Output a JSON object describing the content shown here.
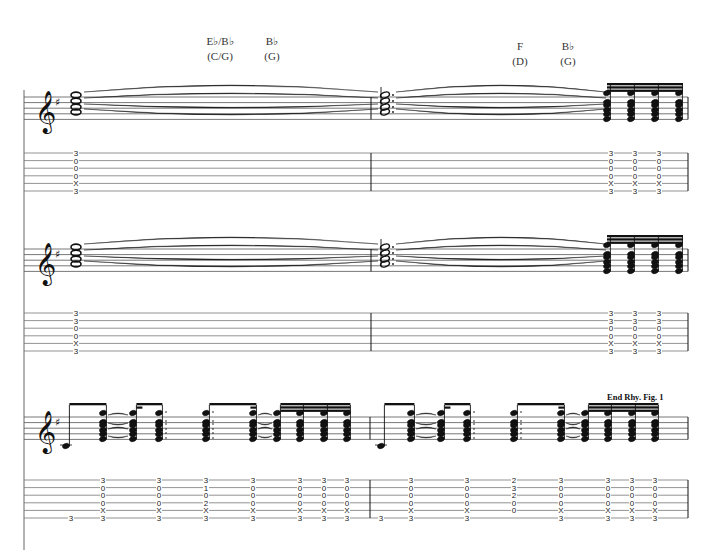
{
  "page": {
    "type": "guitar sheet music with tablature",
    "systems_count": 3
  },
  "chords": [
    {
      "name": "E♭/B♭",
      "capo": "(C/G)",
      "x": 220,
      "y": 34
    },
    {
      "name": "B♭",
      "capo": "(G)",
      "x": 272,
      "y": 34
    },
    {
      "name": "F",
      "capo": "(D)",
      "x": 520,
      "y": 39
    },
    {
      "name": "B♭",
      "capo": "(G)",
      "x": 568,
      "y": 39
    }
  ],
  "rhythm_figure_label": "End Rhy. Fig. 1",
  "clef": "treble",
  "key_signature": "G major (1 sharp)",
  "systems": [
    {
      "id": "system-1",
      "staff_top": 97,
      "tab_top": 153,
      "barline_x": 371,
      "tab_columns": [
        {
          "x": 76,
          "frets": [
            "3",
            "0",
            "0",
            "0",
            "X",
            "3"
          ]
        },
        {
          "x": 611,
          "frets": [
            "3",
            "0",
            "0",
            "0",
            "X",
            "3"
          ]
        },
        {
          "x": 635,
          "frets": [
            "3",
            "0",
            "0",
            "0",
            "X",
            "3"
          ]
        },
        {
          "x": 659,
          "frets": [
            "3",
            "0",
            "0",
            "0",
            "X",
            "3"
          ]
        }
      ]
    },
    {
      "id": "system-2",
      "staff_top": 249,
      "tab_top": 313,
      "barline_x": 371,
      "tab_columns": [
        {
          "x": 76,
          "frets": [
            "3",
            "3",
            "0",
            "0",
            "X",
            "3"
          ]
        },
        {
          "x": 611,
          "frets": [
            "3",
            "3",
            "0",
            "0",
            "X",
            "3"
          ]
        },
        {
          "x": 635,
          "frets": [
            "3",
            "3",
            "0",
            "0",
            "X",
            "3"
          ]
        },
        {
          "x": 659,
          "frets": [
            "3",
            "3",
            "0",
            "0",
            "X",
            "3"
          ]
        }
      ]
    },
    {
      "id": "system-3",
      "staff_top": 417,
      "tab_top": 480,
      "barline_x": 370,
      "tab_columns": [
        {
          "x": 71,
          "frets": [
            "",
            "",
            "",
            "",
            "",
            "3"
          ]
        },
        {
          "x": 103,
          "frets": [
            "3",
            "0",
            "0",
            "0",
            "X",
            "3"
          ]
        },
        {
          "x": 159,
          "frets": [
            "3",
            "0",
            "0",
            "0",
            "X",
            "3"
          ]
        },
        {
          "x": 206,
          "frets": [
            "3",
            "1",
            "0",
            "2",
            "X",
            "3"
          ]
        },
        {
          "x": 253,
          "frets": [
            "3",
            "0",
            "0",
            "0",
            "X",
            "3"
          ]
        },
        {
          "x": 300,
          "frets": [
            "3",
            "0",
            "0",
            "0",
            "X",
            "3"
          ]
        },
        {
          "x": 324,
          "frets": [
            "3",
            "0",
            "0",
            "0",
            "X",
            "3"
          ]
        },
        {
          "x": 347,
          "frets": [
            "3",
            "0",
            "0",
            "0",
            "X",
            "3"
          ]
        },
        {
          "x": 381,
          "frets": [
            "",
            "",
            "",
            "",
            "",
            "3"
          ]
        },
        {
          "x": 411,
          "frets": [
            "3",
            "0",
            "0",
            "0",
            "X",
            "3"
          ]
        },
        {
          "x": 467,
          "frets": [
            "3",
            "0",
            "0",
            "0",
            "X",
            "3"
          ]
        },
        {
          "x": 514,
          "frets": [
            "2",
            "3",
            "2",
            "0",
            "0",
            ""
          ]
        },
        {
          "x": 561,
          "frets": [
            "3",
            "0",
            "0",
            "0",
            "X",
            "3"
          ]
        },
        {
          "x": 608,
          "frets": [
            "3",
            "0",
            "0",
            "0",
            "X",
            "3"
          ]
        },
        {
          "x": 632,
          "frets": [
            "3",
            "0",
            "0",
            "0",
            "X",
            "3"
          ]
        },
        {
          "x": 655,
          "frets": [
            "3",
            "0",
            "0",
            "0",
            "X",
            "3"
          ]
        }
      ]
    }
  ],
  "colors": {
    "ink": "#111111",
    "staff_line": "#555555",
    "tab_line": "#777777",
    "background": "#ffffff"
  }
}
